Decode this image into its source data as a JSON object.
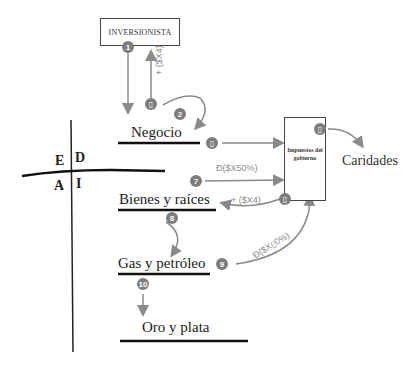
{
  "diagram": {
    "investor_label": "INVERSIONISTA",
    "tax_box_label": "Impuestos del gobierno",
    "charity_label": "Caridades",
    "quadrants": {
      "E": "E",
      "D": "D",
      "A": "A",
      "I": "I"
    },
    "assets": [
      {
        "label": "Negocio"
      },
      {
        "label": "Bienes y raíces"
      },
      {
        "label": "Gas y petróleo"
      },
      {
        "label": "Oro y plata"
      }
    ],
    "badges": {
      "b1": "1",
      "b2": "2",
      "b3": "▯",
      "b4": "▯",
      "b5": "▯",
      "b6": "▯",
      "b7": "7",
      "b8": "8",
      "b9": "9",
      "b10": "10"
    },
    "flow_labels": {
      "investor_return": "+ ($X4)",
      "real_estate_tax": "Đ($X50%)",
      "real_estate_return": "+ ($X4)",
      "oil_gas_tax": "Đ($X▯0%)"
    },
    "colors": {
      "badge": "#7d7d7d",
      "arrow": "#8a8a8a",
      "line": "#111111"
    }
  }
}
